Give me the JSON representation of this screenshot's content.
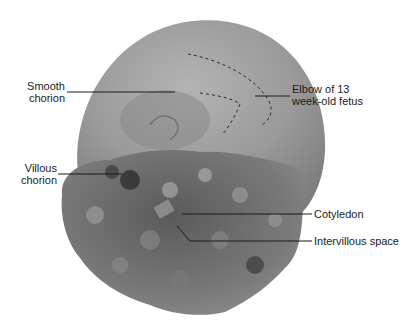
{
  "figure": {
    "colors": {
      "background": "#ffffff",
      "smooth_chorion": "#9a9a9a",
      "smooth_chorion_highlight": "#c4c4c4",
      "villi": "#6e6e6e",
      "villi_dark": "#3a3a3a",
      "villi_light": "#a8a8a8",
      "leader_line": "#1a1a1a",
      "fetus_outline_dash": "#2a2a2a"
    }
  },
  "labels": {
    "smooth_chorion": {
      "line1": "Smooth",
      "line2": "chorion"
    },
    "elbow": {
      "line1": "Elbow of 13",
      "line2": "week-old fetus"
    },
    "villous_chorion": {
      "line1": "Villous",
      "line2": "chorion"
    },
    "cotyledon": {
      "text": "Cotyledon"
    },
    "intervillous_space": {
      "text": "Intervillous space"
    }
  }
}
